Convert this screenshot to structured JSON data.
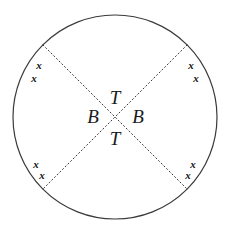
{
  "figure": {
    "background_color": "#ffffff",
    "stroke_color": "#3a3a3a",
    "text_color": "#1a1a1a",
    "circle": {
      "center_x": 115,
      "center_y": 117,
      "radius": 102,
      "stroke_width": 1.2,
      "style": "solid"
    },
    "chords": [
      {
        "name": "chord-nw-se",
        "x1": 43,
        "y1": 45,
        "x2": 187,
        "y2": 189,
        "style": "dotted"
      },
      {
        "name": "chord-ne-sw",
        "x1": 187,
        "y1": 45,
        "x2": 43,
        "y2": 189,
        "style": "dotted"
      }
    ],
    "center_labels": [
      {
        "id": "top",
        "text": "T",
        "x": 115,
        "y": 97
      },
      {
        "id": "left",
        "text": "B",
        "x": 93,
        "y": 116
      },
      {
        "id": "right",
        "text": "B",
        "x": 138,
        "y": 116
      },
      {
        "id": "bottom",
        "text": "T",
        "x": 115,
        "y": 138
      }
    ],
    "tick_marks": [
      {
        "id": "top-left-outer",
        "text": "x",
        "x": 39,
        "y": 65
      },
      {
        "id": "top-left-inner",
        "text": "x",
        "x": 34,
        "y": 78
      },
      {
        "id": "top-right-outer",
        "text": "x",
        "x": 191,
        "y": 65
      },
      {
        "id": "top-right-inner",
        "text": "x",
        "x": 196,
        "y": 78
      },
      {
        "id": "bottom-left-outer",
        "text": "x",
        "x": 36,
        "y": 164
      },
      {
        "id": "bottom-left-inner",
        "text": "x",
        "x": 42,
        "y": 175
      },
      {
        "id": "bottom-right-outer",
        "text": "x",
        "x": 193,
        "y": 164
      },
      {
        "id": "bottom-right-inner",
        "text": "x",
        "x": 188,
        "y": 175
      }
    ]
  }
}
